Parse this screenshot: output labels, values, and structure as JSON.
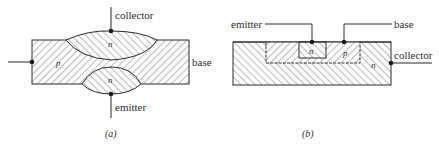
{
  "figure_a": {
    "caption": "(a)",
    "labels": {
      "collector": "collector",
      "base": "base",
      "emitter": "emitter"
    },
    "regions": {
      "base_region": "p",
      "collector_region": "n",
      "emitter_region": "n"
    }
  },
  "figure_b": {
    "caption": "(b)",
    "labels": {
      "emitter": "emitter",
      "base": "base",
      "collector": "collector"
    },
    "regions": {
      "emitter_region": "n",
      "base_region": "p",
      "collector_region": "n"
    }
  },
  "colors": {
    "stroke": "#2a2a2a",
    "hatch": "#555555",
    "background": "#ffffff"
  }
}
